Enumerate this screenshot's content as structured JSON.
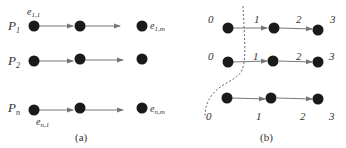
{
  "colors": {
    "node": "#1a1a1a",
    "edge": "#777777",
    "text": "#333333",
    "boundary": "#666666"
  },
  "panel_a": {
    "caption": "(a)",
    "rows": [
      {
        "label": "P",
        "sub": "1",
        "nodes_x": [
          34,
          80,
          142
        ],
        "y": 26
      },
      {
        "label": "P",
        "sub": "2",
        "nodes_x": [
          34,
          80,
          142
        ],
        "y": 61
      },
      {
        "label": "P",
        "sub": "n",
        "nodes_x": [
          34,
          80,
          142
        ],
        "y": 108
      }
    ],
    "event_labels": {
      "top_first": {
        "base": "e",
        "sub": "1,1"
      },
      "top_last": {
        "base": "e",
        "sub": "1,m"
      },
      "bottom_first": {
        "base": "e",
        "sub": "n,1"
      },
      "bottom_last": {
        "base": "e",
        "sub": "n,m"
      }
    }
  },
  "panel_b": {
    "caption": "(b)",
    "row1_labels": [
      "0",
      "1",
      "2",
      "3"
    ],
    "row2_labels": [
      "0",
      "1",
      "2",
      "3"
    ],
    "row3_labels": [
      "0",
      "1",
      "2",
      "3"
    ]
  }
}
